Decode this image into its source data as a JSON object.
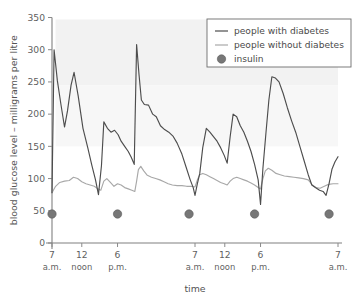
{
  "chart_data": {
    "type": "line",
    "title": "",
    "xlabel": "time",
    "ylabel": "blood glucose level – milligrams per litre",
    "ylim": [
      0,
      350
    ],
    "yticks": [
      0,
      50,
      100,
      150,
      200,
      250,
      300,
      350
    ],
    "ytick_labels": [
      "0",
      "50",
      "100",
      "150",
      "200",
      "250",
      "300",
      "350"
    ],
    "xlim": [
      0,
      48
    ],
    "xticks": [
      0,
      5,
      11,
      24,
      29,
      35,
      48
    ],
    "xtick_labels": [
      "7",
      "12",
      "6",
      "7",
      "12",
      "6",
      "7"
    ],
    "xtick_sublabels": [
      "a.m.",
      "noon",
      "p.m.",
      "a.m.",
      "noon",
      "p.m.",
      "a.m."
    ],
    "grid": false,
    "legend_position": "top-right",
    "series": [
      {
        "name": "people with diabetes",
        "color": "#4d4d4d",
        "style": "line",
        "points": [
          [
            0.0,
            78
          ],
          [
            0.35,
            300
          ],
          [
            0.9,
            252
          ],
          [
            1.5,
            215
          ],
          [
            2.1,
            180
          ],
          [
            2.6,
            205
          ],
          [
            3.2,
            245
          ],
          [
            3.7,
            265
          ],
          [
            4.4,
            228
          ],
          [
            5.2,
            178
          ],
          [
            6.0,
            148
          ],
          [
            6.7,
            120
          ],
          [
            7.3,
            98
          ],
          [
            7.8,
            75
          ],
          [
            8.3,
            120
          ],
          [
            8.7,
            188
          ],
          [
            9.3,
            178
          ],
          [
            9.9,
            172
          ],
          [
            10.5,
            175
          ],
          [
            11.1,
            168
          ],
          [
            11.6,
            158
          ],
          [
            12.2,
            150
          ],
          [
            12.8,
            142
          ],
          [
            13.3,
            133
          ],
          [
            13.8,
            122
          ],
          [
            14.2,
            308
          ],
          [
            14.6,
            262
          ],
          [
            15.0,
            222
          ],
          [
            15.5,
            215
          ],
          [
            16.2,
            214
          ],
          [
            16.9,
            200
          ],
          [
            17.5,
            196
          ],
          [
            18.2,
            182
          ],
          [
            18.9,
            176
          ],
          [
            19.6,
            172
          ],
          [
            20.3,
            166
          ],
          [
            21.0,
            155
          ],
          [
            21.8,
            138
          ],
          [
            22.5,
            118
          ],
          [
            23.2,
            98
          ],
          [
            23.7,
            86
          ],
          [
            24.0,
            74
          ],
          [
            24.4,
            92
          ],
          [
            24.8,
            108
          ],
          [
            25.3,
            148
          ],
          [
            25.9,
            178
          ],
          [
            26.5,
            172
          ],
          [
            27.1,
            165
          ],
          [
            27.7,
            158
          ],
          [
            28.3,
            148
          ],
          [
            28.9,
            136
          ],
          [
            29.4,
            124
          ],
          [
            29.9,
            165
          ],
          [
            30.4,
            200
          ],
          [
            31.0,
            196
          ],
          [
            31.6,
            182
          ],
          [
            32.2,
            172
          ],
          [
            32.8,
            158
          ],
          [
            33.4,
            142
          ],
          [
            34.0,
            122
          ],
          [
            34.6,
            98
          ],
          [
            35.0,
            60
          ],
          [
            35.4,
            116
          ],
          [
            35.9,
            170
          ],
          [
            36.4,
            222
          ],
          [
            36.9,
            258
          ],
          [
            37.5,
            256
          ],
          [
            38.1,
            250
          ],
          [
            38.8,
            232
          ],
          [
            39.5,
            210
          ],
          [
            40.2,
            190
          ],
          [
            40.9,
            172
          ],
          [
            41.6,
            150
          ],
          [
            42.3,
            128
          ],
          [
            43.0,
            106
          ],
          [
            43.6,
            90
          ],
          [
            44.2,
            86
          ],
          [
            44.9,
            82
          ],
          [
            45.5,
            80
          ],
          [
            46.0,
            74
          ],
          [
            46.5,
            92
          ],
          [
            47.0,
            115
          ],
          [
            47.5,
            126
          ],
          [
            48.0,
            134
          ]
        ]
      },
      {
        "name": "people without diabetes",
        "color": "#a8a8a8",
        "style": "line",
        "points": [
          [
            0.0,
            78
          ],
          [
            0.6,
            88
          ],
          [
            1.3,
            94
          ],
          [
            2.1,
            96
          ],
          [
            2.9,
            97
          ],
          [
            3.6,
            102
          ],
          [
            4.3,
            100
          ],
          [
            5.0,
            95
          ],
          [
            5.7,
            92
          ],
          [
            6.4,
            90
          ],
          [
            7.1,
            88
          ],
          [
            7.7,
            84
          ],
          [
            8.2,
            82
          ],
          [
            8.7,
            96
          ],
          [
            9.2,
            100
          ],
          [
            9.8,
            94
          ],
          [
            10.4,
            88
          ],
          [
            11.0,
            92
          ],
          [
            11.6,
            90
          ],
          [
            12.2,
            86
          ],
          [
            12.8,
            84
          ],
          [
            13.4,
            82
          ],
          [
            13.9,
            80
          ],
          [
            14.2,
            96
          ],
          [
            14.5,
            114
          ],
          [
            14.9,
            119
          ],
          [
            15.4,
            112
          ],
          [
            16.0,
            105
          ],
          [
            16.7,
            102
          ],
          [
            17.4,
            100
          ],
          [
            18.1,
            98
          ],
          [
            18.8,
            95
          ],
          [
            19.5,
            92
          ],
          [
            20.2,
            90
          ],
          [
            21.0,
            89
          ],
          [
            21.8,
            89
          ],
          [
            22.6,
            88
          ],
          [
            23.3,
            88
          ],
          [
            24.0,
            87
          ],
          [
            24.4,
            98
          ],
          [
            24.8,
            106
          ],
          [
            25.3,
            108
          ],
          [
            25.9,
            106
          ],
          [
            26.5,
            103
          ],
          [
            27.1,
            100
          ],
          [
            27.7,
            97
          ],
          [
            28.3,
            94
          ],
          [
            28.9,
            92
          ],
          [
            29.4,
            90
          ],
          [
            29.9,
            96
          ],
          [
            30.4,
            100
          ],
          [
            31.0,
            102
          ],
          [
            31.6,
            100
          ],
          [
            32.2,
            98
          ],
          [
            32.8,
            96
          ],
          [
            33.4,
            93
          ],
          [
            34.0,
            90
          ],
          [
            34.6,
            86
          ],
          [
            35.0,
            84
          ],
          [
            35.4,
            100
          ],
          [
            35.8,
            112
          ],
          [
            36.3,
            116
          ],
          [
            36.9,
            113
          ],
          [
            37.6,
            108
          ],
          [
            38.3,
            106
          ],
          [
            39.0,
            104
          ],
          [
            39.8,
            103
          ],
          [
            40.6,
            102
          ],
          [
            41.4,
            101
          ],
          [
            42.2,
            100
          ],
          [
            43.0,
            98
          ],
          [
            43.7,
            90
          ],
          [
            44.3,
            86
          ],
          [
            45.0,
            85
          ],
          [
            45.7,
            88
          ],
          [
            46.4,
            91
          ],
          [
            47.2,
            92
          ],
          [
            48.0,
            92
          ]
        ]
      }
    ],
    "markers": {
      "name": "insulin",
      "color": "#777777",
      "y_value": 45,
      "x_values": [
        0,
        11,
        23,
        34,
        46.5
      ]
    },
    "legend_entries": [
      {
        "label": "people with diabetes",
        "marker": "line",
        "color": "#4d4d4d"
      },
      {
        "label": "people without diabetes",
        "marker": "line",
        "color": "#a8a8a8"
      },
      {
        "label": "insulin",
        "marker": "dot",
        "color": "#777777"
      }
    ]
  }
}
